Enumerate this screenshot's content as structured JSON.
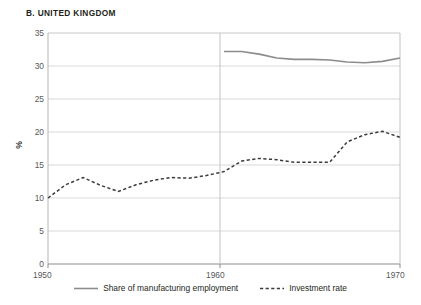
{
  "figure": {
    "panel_letter": "B.",
    "title": "UNITED KINGDOM",
    "title_full": "B.  UNITED KINGDOM"
  },
  "axes": {
    "ylabel": "%",
    "yticks": [
      "0",
      "5",
      "10",
      "15",
      "20",
      "25",
      "30",
      "35"
    ],
    "xticks": [
      "1950",
      "1960",
      "1970"
    ]
  },
  "legend": {
    "items": [
      {
        "label": "Share of manufacturing employment",
        "style": "solid",
        "color": "#8c8c8c"
      },
      {
        "label": "Investment rate",
        "style": "dashed",
        "color": "#3b3b3b"
      }
    ]
  },
  "colors": {
    "solid_line": "#8c8c8c",
    "dashed_line": "#3b3b3b",
    "grid": "#d9d9d9",
    "axis": "#939393",
    "text": "#231f20",
    "tick_text": "#58585b",
    "background": "#ffffff"
  },
  "chart_data": {
    "type": "line",
    "title": "B. UNITED KINGDOM",
    "xlabel": "",
    "ylabel": "%",
    "xlim": [
      1950,
      1970
    ],
    "ylim": [
      0,
      35
    ],
    "yticks": [
      0,
      5,
      10,
      15,
      20,
      25,
      30,
      35
    ],
    "xticks": [
      1950,
      1960,
      1970
    ],
    "grid": "horizontal",
    "legend_position": "bottom-center",
    "series": [
      {
        "name": "Share of manufacturing employment",
        "style": "solid",
        "color": "#8c8c8c",
        "x": [
          1960,
          1961,
          1962,
          1963,
          1964,
          1965,
          1966,
          1967,
          1968,
          1969,
          1970
        ],
        "values": [
          32.2,
          32.2,
          31.8,
          31.2,
          31.0,
          31.0,
          30.9,
          30.6,
          30.5,
          30.7,
          31.2
        ]
      },
      {
        "name": "Investment rate",
        "style": "dashed",
        "color": "#3b3b3b",
        "x": [
          1950,
          1951,
          1952,
          1953,
          1954,
          1955,
          1956,
          1957,
          1958,
          1959,
          1960,
          1961,
          1962,
          1963,
          1964,
          1965,
          1966,
          1967,
          1968,
          1969,
          1970
        ],
        "values": [
          10.0,
          12.0,
          13.1,
          11.9,
          11.0,
          12.0,
          12.7,
          13.1,
          13.0,
          13.4,
          14.0,
          15.6,
          16.0,
          15.8,
          15.4,
          15.4,
          15.4,
          18.5,
          18.4,
          18.0,
          18.2
        ]
      }
    ],
    "series_extra_note": {
      "investment_rate_tail_x": [
        1967,
        1968,
        1969,
        1970
      ],
      "investment_rate_tail_values": [
        18.5,
        19.6,
        20.1,
        19.2
      ]
    }
  }
}
